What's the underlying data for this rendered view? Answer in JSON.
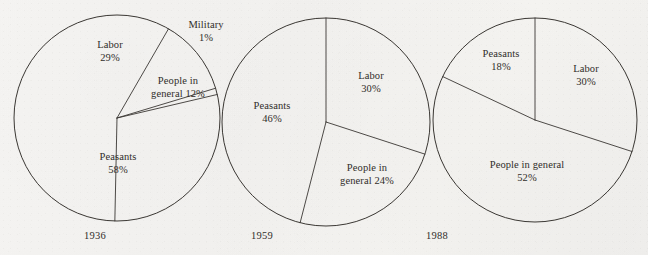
{
  "figure": {
    "background_color": "#f4f3f1",
    "line_color": "#3a3733",
    "text_color": "#302d2a"
  },
  "chart_data": [
    {
      "type": "pie",
      "title": "1936",
      "year_label": "1936",
      "center": [
        117,
        118
      ],
      "radius": 103,
      "start_angle_deg": -60,
      "categories": [
        "People in general",
        "Military",
        "Labor",
        "Peasants"
      ],
      "values": [
        12,
        1,
        29,
        58
      ],
      "labels": [
        {
          "name": "Labor",
          "value_text": "29%",
          "line1": "Labor",
          "line2": "29%",
          "x": 110,
          "y": 52
        },
        {
          "name": "Military",
          "value_text": "1%",
          "line1": "Military",
          "line2": "1%",
          "x": 206,
          "y": 32
        },
        {
          "name": "People in general",
          "value_text": "12%",
          "line1": "People in",
          "line2": "general 12%",
          "x": 178,
          "y": 88
        },
        {
          "name": "Peasants",
          "value_text": "58%",
          "line1": "Peasants",
          "line2": "58%",
          "x": 118,
          "y": 164
        }
      ],
      "year_pos": [
        95,
        235
      ]
    },
    {
      "type": "pie",
      "title": "1959",
      "year_label": "1959",
      "center": [
        326,
        122
      ],
      "radius": 104,
      "start_angle_deg": -90,
      "categories": [
        "Labor",
        "People in general",
        "Peasants"
      ],
      "values": [
        30,
        24,
        46
      ],
      "labels": [
        {
          "name": "Labor",
          "value_text": "30%",
          "line1": "Labor",
          "line2": "30%",
          "x": 371,
          "y": 83
        },
        {
          "name": "People in general",
          "value_text": "24%",
          "line1": "People in",
          "line2": "general 24%",
          "x": 367,
          "y": 175
        },
        {
          "name": "Peasants",
          "value_text": "46%",
          "line1": "Peasants",
          "line2": "46%",
          "x": 272,
          "y": 113
        }
      ],
      "year_pos": [
        262,
        235
      ]
    },
    {
      "type": "pie",
      "title": "1988",
      "year_label": "1988",
      "center": [
        535,
        120
      ],
      "radius": 102,
      "start_angle_deg": -90,
      "categories": [
        "Labor",
        "People in general",
        "Peasants"
      ],
      "values": [
        30,
        52,
        18
      ],
      "labels": [
        {
          "name": "Peasants",
          "value_text": "18%",
          "line1": "Peasants",
          "line2": "18%",
          "x": 501,
          "y": 61
        },
        {
          "name": "Labor",
          "value_text": "30%",
          "line1": "Labor",
          "line2": "30%",
          "x": 586,
          "y": 76
        },
        {
          "name": "People in general",
          "value_text": "52%",
          "line1": "People in general",
          "line2": "52%",
          "x": 527,
          "y": 172
        }
      ],
      "year_pos": [
        437,
        235
      ]
    }
  ]
}
